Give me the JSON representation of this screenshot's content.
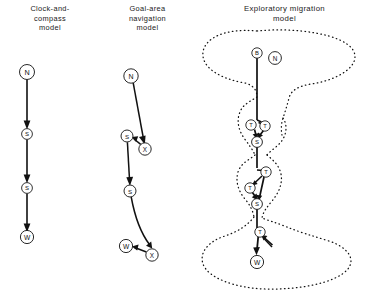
{
  "figure": {
    "type": "diagram",
    "panel_count": 3
  },
  "panels": [
    {
      "id": "clock-and-compass",
      "title": "Clock-and-\ncompass\nmodel",
      "title_lines": [
        "Clock-and-",
        "compass",
        "model"
      ],
      "nodes": [
        {
          "id": "n1",
          "label": "N",
          "x": 27,
          "y": 72,
          "r": 7.5,
          "font": 7.2
        },
        {
          "id": "n2",
          "label": "S",
          "x": 27,
          "y": 134,
          "r": 5.4,
          "font": 6.0
        },
        {
          "id": "n3",
          "label": "S",
          "x": 27,
          "y": 188,
          "r": 5.4,
          "font": 6.0
        },
        {
          "id": "n4",
          "label": "W",
          "x": 27,
          "y": 237,
          "r": 6.6,
          "font": 6.6
        }
      ],
      "edges": [
        {
          "from": "n1",
          "to": "n2",
          "style": "straight"
        },
        {
          "from": "n2",
          "to": "n3",
          "style": "straight"
        },
        {
          "from": "n3",
          "to": "n4",
          "style": "straight"
        }
      ]
    },
    {
      "id": "goal-area-navigation",
      "title": "Goal-area\nnavigation\nmodel",
      "title_lines": [
        "Goal-area",
        "navigation",
        "model"
      ],
      "nodes": [
        {
          "id": "g1",
          "label": "N",
          "x": 31,
          "y": 76,
          "r": 7.2,
          "font": 7.0
        },
        {
          "id": "g2",
          "label": "X",
          "x": 45,
          "y": 149,
          "r": 6.2,
          "font": 6.4
        },
        {
          "id": "g3",
          "label": "S",
          "x": 27,
          "y": 136,
          "r": 6.0,
          "font": 6.2
        },
        {
          "id": "g4",
          "label": "S",
          "x": 30,
          "y": 191,
          "r": 6.0,
          "font": 6.2
        },
        {
          "id": "g5",
          "label": "X",
          "x": 52,
          "y": 255,
          "r": 6.2,
          "font": 6.4
        },
        {
          "id": "g6",
          "label": "W",
          "x": 26,
          "y": 246,
          "r": 6.6,
          "font": 6.6
        }
      ],
      "edges": [
        {
          "from": "g1",
          "to": "g2",
          "style": "straight"
        },
        {
          "from": "g2",
          "to": "g3",
          "style": "straight"
        },
        {
          "from": "g3",
          "to": "g4",
          "style": "straight"
        },
        {
          "from": "g4",
          "to": "g5",
          "style": "curve"
        },
        {
          "from": "g5",
          "to": "g6",
          "style": "straight"
        }
      ]
    },
    {
      "id": "exploratory-migration",
      "title": "Exploratory migration\nmodel",
      "title_lines": [
        "Exploratory migration",
        "model"
      ],
      "nodes": [
        {
          "id": "e-b",
          "label": "B",
          "x": 62,
          "y": 53,
          "r": 5.2,
          "font": 5.8
        },
        {
          "id": "e-n",
          "label": "N",
          "x": 80,
          "y": 58,
          "r": 6.4,
          "font": 6.4
        },
        {
          "id": "e-t1",
          "label": "T",
          "x": 56,
          "y": 125,
          "r": 5.2,
          "font": 5.8
        },
        {
          "id": "e-t2",
          "label": "T",
          "x": 70,
          "y": 126,
          "r": 5.2,
          "font": 5.8
        },
        {
          "id": "e-s1",
          "label": "S",
          "x": 62,
          "y": 142,
          "r": 5.4,
          "font": 6.0
        },
        {
          "id": "e-t3",
          "label": "T",
          "x": 71,
          "y": 172,
          "r": 5.2,
          "font": 5.8
        },
        {
          "id": "e-t4",
          "label": "T",
          "x": 55,
          "y": 188,
          "r": 5.2,
          "font": 5.8
        },
        {
          "id": "e-s2",
          "label": "S",
          "x": 62,
          "y": 204,
          "r": 5.4,
          "font": 6.0
        },
        {
          "id": "e-t5",
          "label": "T",
          "x": 65,
          "y": 232,
          "r": 5.2,
          "font": 5.8
        },
        {
          "id": "e-w",
          "label": "W",
          "x": 62,
          "y": 262,
          "r": 6.6,
          "font": 6.6
        }
      ],
      "regions": [
        {
          "id": "region-top",
          "shape": "large-oval"
        },
        {
          "id": "region-mid-upper",
          "shape": "small-blob"
        },
        {
          "id": "region-mid-lower",
          "shape": "small-blob"
        },
        {
          "id": "region-bottom",
          "shape": "large-oval"
        }
      ]
    }
  ]
}
